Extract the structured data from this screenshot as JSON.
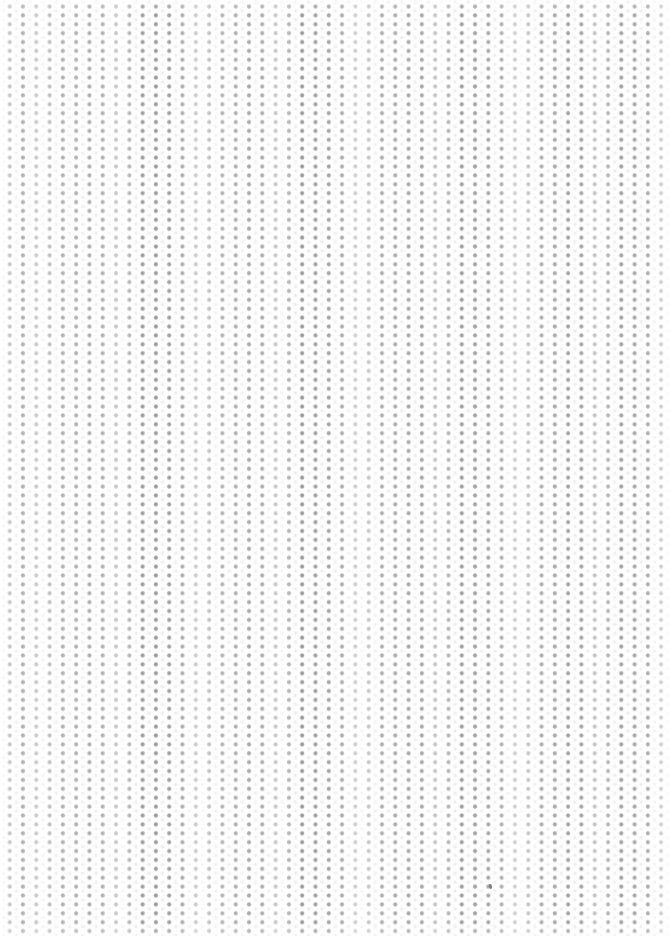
{
  "canvas": {
    "width": 672,
    "height": 936,
    "background_color": "#fdfdfd",
    "description": "Blank dotted texture surface — no interface elements, text, or controls are visible."
  },
  "texture": {
    "name": "dot-grid",
    "dot_color": "#9a9a9a",
    "dot_highlight_color": "#bdbdbd",
    "background_color": "#fdfdfd",
    "dot_diameter_px": 3,
    "spacing_x_px": 13.3,
    "spacing_y_px": 8.9,
    "origin_x_px": 3,
    "origin_y_px": 2,
    "ghost_dot_color": "#afafaf",
    "ghost_dot_opacity": 0.3
  },
  "banding": {
    "name": "vertical-moire-banding",
    "highlight_color": "#ffffff",
    "narrow_period_px": 80,
    "wide_period_px": 150,
    "narrow_opacity": 0.4,
    "wide_opacity": 0.26
  },
  "edges": {
    "left_fade_width_px": 26,
    "right_fade_width_px": 26,
    "top_fade_height_px": 10,
    "bottom_fade_height_px": 10,
    "fade_color": "#ffffff"
  },
  "cursor": {
    "name": "cursor-speck",
    "color": "#6f6f6f",
    "x_px": 489,
    "y_px": 884,
    "width_px": 3,
    "height_px": 5,
    "rotation_deg": -12
  }
}
